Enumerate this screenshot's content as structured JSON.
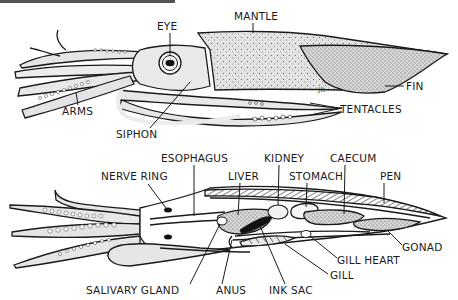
{
  "diagram": {
    "colors": {
      "ink": "#1a1a1a",
      "body": "#e4e4e4",
      "paper": "#ffffff",
      "ink_sac": "#111111"
    },
    "external_view": {
      "labels": {
        "eye": "EYE",
        "mantle": "MANTLE",
        "fin": "FIN",
        "tentacles": "TENTACLES",
        "arms": "ARMS",
        "siphon": "SIPHON"
      },
      "signature": "JR"
    },
    "internal_view": {
      "labels": {
        "esophagus": "ESOPHAGUS",
        "nerve_ring": "NERVE RING",
        "liver": "LIVER",
        "kidney": "KIDNEY",
        "stomach": "STOMACH",
        "caecum": "CAECUM",
        "pen": "PEN",
        "gonad": "GONAD",
        "gill_heart": "GILL HEART",
        "gill": "GILL",
        "salivary_gland": "SALIVARY GLAND",
        "anus": "ANUS",
        "ink_sac": "INK SAC"
      }
    }
  }
}
